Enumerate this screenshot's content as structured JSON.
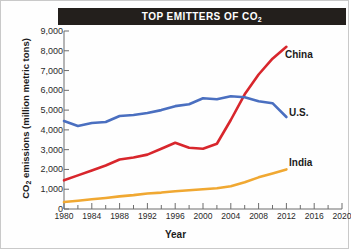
{
  "title": {
    "main": "TOP EMITTERS OF CO",
    "sub": "2",
    "full": "TOP EMITTERS OF CO2"
  },
  "axes": {
    "ylabel_main": "CO",
    "ylabel_sub": "2",
    "ylabel_rest": " emissions (million metric tons)",
    "ylabel_full": "CO2 emissions (million metric tons)",
    "xlabel": "Year"
  },
  "colors": {
    "china": "#d8262c",
    "us": "#4a6fc0",
    "india": "#f0a832",
    "banner": "#231f1c",
    "axis": "#6d6d6d",
    "text": "#1b1b1b"
  },
  "chart_data": {
    "type": "line",
    "title": "TOP EMITTERS OF CO2",
    "xlabel": "Year",
    "ylabel": "CO2 emissions (million metric tons)",
    "xlim": [
      1980,
      2020
    ],
    "ylim": [
      0,
      9000
    ],
    "xticks": [
      1980,
      1984,
      1988,
      1992,
      1996,
      2000,
      2004,
      2008,
      2012,
      2016,
      2020
    ],
    "xtick_labels": [
      "1980",
      "1984",
      "1988",
      "1992",
      "1996",
      "2000",
      "2004",
      "2008",
      "2012",
      "2016",
      "2020"
    ],
    "minor_xtick_interval": 2,
    "yticks": [
      0,
      1000,
      2000,
      3000,
      4000,
      5000,
      6000,
      7000,
      8000,
      9000
    ],
    "ytick_labels": [
      "0",
      "1,000",
      "2,000",
      "3,000",
      "4,000",
      "5,000",
      "6,000",
      "7,000",
      "8,000",
      "9,000"
    ],
    "grid": false,
    "legend": "inline-right-of-series-ends",
    "series": [
      {
        "name": "China",
        "color": "#d8262c",
        "label_position": {
          "x": 2013,
          "y": 8200
        },
        "x": [
          1980,
          1982,
          1984,
          1986,
          1988,
          1990,
          1992,
          1994,
          1996,
          1998,
          2000,
          2002,
          2004,
          2006,
          2008,
          2010,
          2012
        ],
        "values": [
          1450,
          1700,
          1950,
          2200,
          2500,
          2600,
          2750,
          3050,
          3350,
          3100,
          3050,
          3300,
          4500,
          5800,
          6800,
          7600,
          8200
        ]
      },
      {
        "name": "U.S.",
        "color": "#4a6fc0",
        "label_position": {
          "x": 2013,
          "y": 4700
        },
        "x": [
          1980,
          1982,
          1984,
          1986,
          1988,
          1990,
          1992,
          1994,
          1996,
          1998,
          2000,
          2002,
          2004,
          2006,
          2008,
          2010,
          2012
        ],
        "values": [
          4450,
          4200,
          4350,
          4400,
          4700,
          4750,
          4850,
          5000,
          5200,
          5300,
          5600,
          5550,
          5700,
          5650,
          5450,
          5350,
          4650
        ]
      },
      {
        "name": "India",
        "color": "#f0a832",
        "label_position": {
          "x": 2013,
          "y": 2000
        },
        "x": [
          1980,
          1982,
          1984,
          1986,
          1988,
          1990,
          1992,
          1994,
          1996,
          1998,
          2000,
          2002,
          2004,
          2006,
          2008,
          2010,
          2012
        ],
        "values": [
          350,
          420,
          490,
          560,
          640,
          700,
          780,
          830,
          900,
          950,
          1000,
          1050,
          1150,
          1350,
          1600,
          1800,
          2000
        ]
      }
    ]
  },
  "series_labels": {
    "china": "China",
    "us": "U.S.",
    "india": "India"
  }
}
